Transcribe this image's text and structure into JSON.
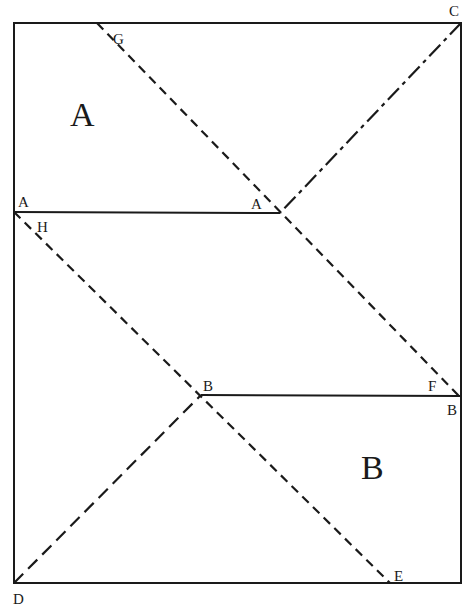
{
  "diagram": {
    "type": "geometric-dissection",
    "stroke_color": "#1a1a1a",
    "background": "#ffffff",
    "region_labels": {
      "upper": "A",
      "lower": "B"
    },
    "point_labels": {
      "G": "G",
      "C": "C",
      "A_left": "A",
      "A_mid": "A",
      "H": "H",
      "B_mid": "B",
      "F": "F",
      "B_right": "B",
      "D": "D",
      "E": "E"
    },
    "lines": [
      {
        "name": "outer-rectangle",
        "style": "solid"
      },
      {
        "name": "line-A-A",
        "from": "A",
        "to": "A",
        "style": "solid"
      },
      {
        "name": "line-B-B",
        "from": "B",
        "to": "B",
        "style": "solid"
      },
      {
        "name": "line-G-F",
        "from": "G",
        "to": "F",
        "style": "dashed"
      },
      {
        "name": "line-H-E",
        "from": "H",
        "to": "E",
        "style": "dashed"
      },
      {
        "name": "line-C-A",
        "from": "C",
        "to": "A",
        "style": "dash-dot"
      },
      {
        "name": "line-D-B",
        "from": "D",
        "to": "B",
        "style": "long-dash"
      }
    ]
  }
}
